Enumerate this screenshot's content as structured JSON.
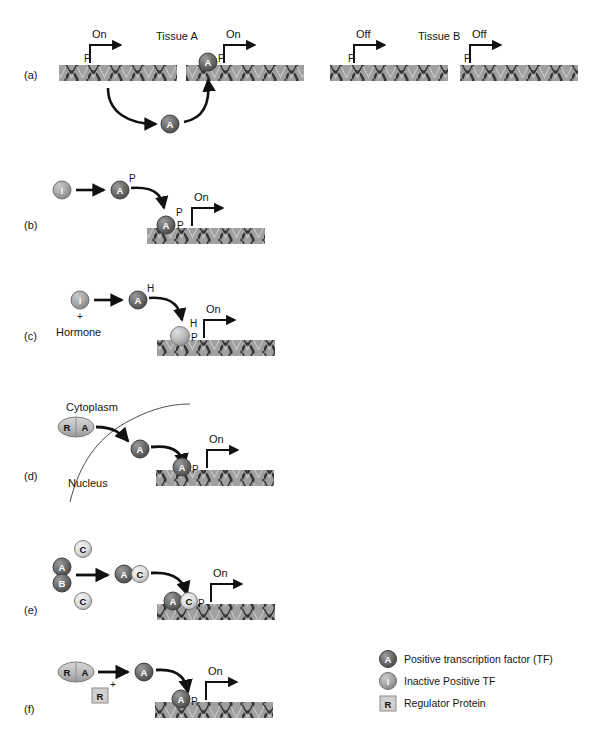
{
  "figure": {
    "background": "#ffffff",
    "colors": {
      "dna_bar": "#9e9e9e",
      "dna_helix": "#3a3a3a",
      "tf_active": "#6e6e6e",
      "tf_inactive": "#a8a8a8",
      "cofactor_c": "#e2e2e2",
      "regulator": "#cfcfcf",
      "arrow": "#111111",
      "text": "#151515"
    }
  },
  "panels": [
    {
      "id": "a",
      "label": "(a)",
      "tissues": [
        {
          "name": "Tissue A",
          "states": [
            "On",
            "On"
          ]
        },
        {
          "name": "Tissue B",
          "states": [
            "Off",
            "Off"
          ]
        }
      ],
      "promoter_marks": [
        "P",
        "P",
        "P",
        "P"
      ],
      "free_factor": "A",
      "bound_factor": "A",
      "bound_mark": "P"
    },
    {
      "id": "b",
      "label": "(b)",
      "inactive_factor": "I",
      "active_factor": "A",
      "active_mark": "P",
      "bound_factor": "A",
      "bound_marks": [
        "P",
        "P"
      ],
      "state": "On"
    },
    {
      "id": "c",
      "label": "(c)",
      "inactive_factor": "I",
      "plus": "+",
      "ligand": "Hormone",
      "active_factor": "A",
      "active_mark": "H",
      "bound_marks": [
        "H",
        "P"
      ],
      "state": "On"
    },
    {
      "id": "d",
      "label": "(d)",
      "compartments": [
        "Cytoplasm",
        "Nucleus"
      ],
      "complex": [
        "R",
        "A"
      ],
      "released_factor": "A",
      "bound_factor": "A",
      "bound_mark": "P",
      "state": "On"
    },
    {
      "id": "e",
      "label": "(e)",
      "dimer": [
        "A",
        "B"
      ],
      "free_cofactors": [
        "C",
        "C"
      ],
      "heterodimer": [
        "A",
        "C"
      ],
      "bound_pair": [
        "A",
        "C"
      ],
      "bound_mark": "P",
      "state": "On"
    },
    {
      "id": "f",
      "label": "(f)",
      "complex": [
        "R",
        "A"
      ],
      "plus": "+",
      "released_regulator": "R",
      "released_factor": "A",
      "bound_factor": "A",
      "bound_mark": "P",
      "state": "On"
    }
  ],
  "legend": {
    "items": [
      {
        "glyph": "A",
        "shape": "circle",
        "color": "#6e6e6e",
        "label": "Positive transcription factor (TF)"
      },
      {
        "glyph": "I",
        "shape": "circle",
        "color": "#a8a8a8",
        "label": "Inactive Positive TF"
      },
      {
        "glyph": "R",
        "shape": "square",
        "color": "#cfcfcf",
        "label": "Regulator Protein"
      }
    ]
  }
}
